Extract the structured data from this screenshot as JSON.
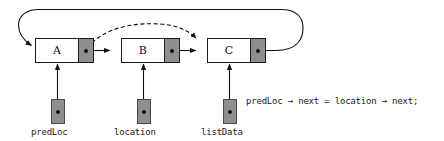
{
  "diagram": {
    "colors": {
      "pointer_field_fill": "#8f8f8f",
      "data_field_fill": "#ffffff",
      "stroke": "#1a1a1a",
      "background": "#ffffff"
    },
    "nodes": [
      {
        "label": "A",
        "name": "node-a"
      },
      {
        "label": "B",
        "name": "node-b"
      },
      {
        "label": "C",
        "name": "node-c"
      }
    ],
    "variables": [
      {
        "label": "predLoc",
        "name": "variable-predloc"
      },
      {
        "label": "location",
        "name": "variable-location"
      },
      {
        "label": "listData",
        "name": "variable-listdata"
      }
    ],
    "code": {
      "expression": "predLoc → next = location → next;"
    },
    "arrows": {
      "a_to_b": "solid-next-pointer",
      "b_to_c": "solid-next-pointer",
      "c_loop_to_a": "solid-loop-back",
      "a_to_c_dashed": "dashed-new-pointer"
    }
  }
}
